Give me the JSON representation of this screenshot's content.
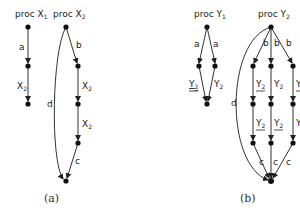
{
  "figure_a": {
    "caption": "(a)",
    "proc_x1": {
      "title": "proc X",
      "sub": "1",
      "edges": [
        {
          "label": "a",
          "sub": ""
        },
        {
          "label": "X",
          "sub": "2"
        }
      ]
    },
    "proc_x2": {
      "title": "proc X",
      "sub": "2",
      "edges": [
        {
          "label": "b",
          "sub": ""
        },
        {
          "label": "X",
          "sub": "2"
        },
        {
          "label": "X",
          "sub": "2"
        },
        {
          "label": "c",
          "sub": ""
        },
        {
          "label": "d",
          "sub": ""
        }
      ]
    }
  },
  "figure_b": {
    "caption": "(b)",
    "proc_y1": {
      "title": "proc Y",
      "sub": "1",
      "edges": [
        {
          "label": "a",
          "sub": ""
        },
        {
          "label": "a",
          "sub": ""
        },
        {
          "label": "Y",
          "sub": "2",
          "underlined": true
        },
        {
          "label": "Y",
          "sub": "2",
          "underlined": false
        }
      ]
    },
    "proc_y2": {
      "title": "proc Y",
      "sub": "2",
      "edges": [
        {
          "label": "b",
          "sub": ""
        },
        {
          "label": "b",
          "sub": ""
        },
        {
          "label": "b",
          "sub": ""
        },
        {
          "label": "Y",
          "sub": "2",
          "underlined": true
        },
        {
          "label": "Y",
          "sub": "2",
          "underlined": false
        },
        {
          "label": "Y",
          "sub": "2",
          "underlined": true
        },
        {
          "label": "Y",
          "sub": "2",
          "underlined": true
        },
        {
          "label": "Y",
          "sub": "2",
          "underlined": true
        },
        {
          "label": "Y",
          "sub": "2",
          "underlined": false
        },
        {
          "label": "c",
          "sub": ""
        },
        {
          "label": "c",
          "sub": ""
        },
        {
          "label": "c",
          "sub": ""
        },
        {
          "label": "d",
          "sub": ""
        }
      ]
    }
  }
}
